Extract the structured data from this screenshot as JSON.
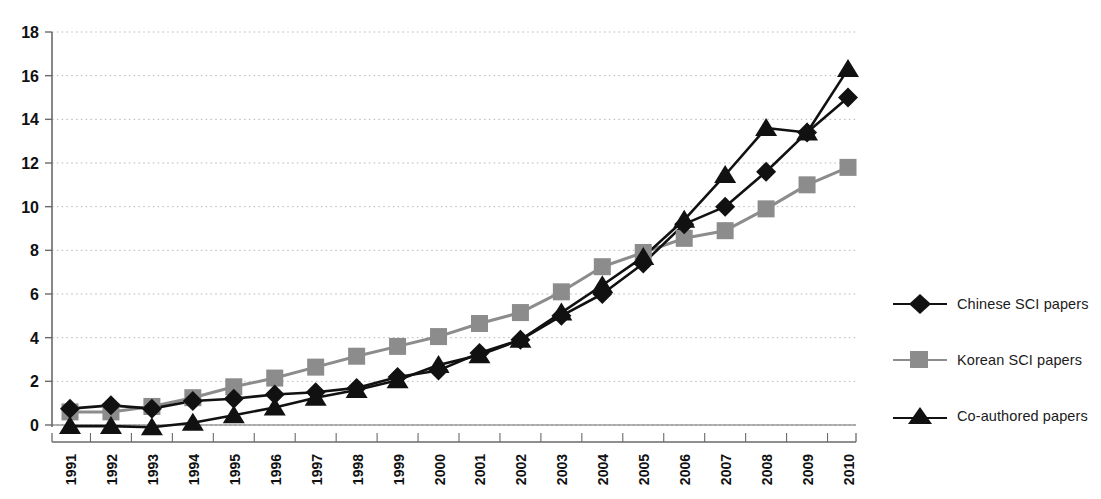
{
  "chart_data": {
    "type": "line",
    "title": "",
    "subtitle": "",
    "xlabel": "",
    "ylabel": "",
    "grid": true,
    "legend_position": "right",
    "xlim": [
      "1991",
      "2010"
    ],
    "ylim": [
      0,
      18
    ],
    "ytick_step": 2,
    "yticks": [
      0,
      2,
      4,
      6,
      8,
      10,
      12,
      14,
      16,
      18
    ],
    "categories": [
      "1991",
      "1992",
      "1993",
      "1994",
      "1995",
      "1996",
      "1997",
      "1998",
      "1999",
      "2000",
      "2001",
      "2002",
      "2003",
      "2004",
      "2005",
      "2006",
      "2007",
      "2008",
      "2009",
      "2010"
    ],
    "series": [
      {
        "name": "Chinese SCI papers",
        "marker": "diamond",
        "color": "#111111",
        "line_color": "#111111",
        "values": [
          0.75,
          0.9,
          0.75,
          1.1,
          1.2,
          1.4,
          1.5,
          1.7,
          2.2,
          2.5,
          3.3,
          3.9,
          5.0,
          6.0,
          7.4,
          9.2,
          10.0,
          11.6,
          13.4,
          15.0
        ]
      },
      {
        "name": "Korean SCI papers",
        "marker": "square",
        "color": "#8c8c8c",
        "line_color": "#8c8c8c",
        "values": [
          0.6,
          0.6,
          0.85,
          1.25,
          1.75,
          2.15,
          2.65,
          3.15,
          3.6,
          4.05,
          4.65,
          5.15,
          6.1,
          7.25,
          7.9,
          8.55,
          8.9,
          9.9,
          11.0,
          11.8
        ]
      },
      {
        "name": "Co-authored papers",
        "marker": "triangle",
        "color": "#111111",
        "line_color": "#111111",
        "values": [
          -0.05,
          -0.05,
          -0.1,
          0.1,
          0.45,
          0.8,
          1.25,
          1.6,
          2.05,
          2.75,
          3.2,
          3.9,
          5.15,
          6.4,
          7.7,
          9.4,
          11.45,
          13.6,
          13.4,
          16.3
        ]
      }
    ]
  },
  "legend": {
    "items": [
      {
        "label": "Chinese SCI papers",
        "marker": "diamond",
        "color": "#111111"
      },
      {
        "label": "Korean SCI papers",
        "marker": "square",
        "color": "#8c8c8c"
      },
      {
        "label": "Co-authored papers",
        "marker": "triangle",
        "color": "#111111"
      }
    ]
  },
  "colors": {
    "axis": "#6a6a6a",
    "grid": "#b9b9b9",
    "chinese": "#111111",
    "korean": "#8c8c8c",
    "coauthored": "#111111",
    "background": "#ffffff"
  }
}
